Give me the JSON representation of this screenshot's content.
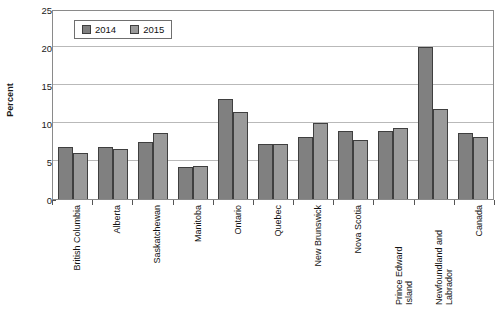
{
  "chart_data": {
    "type": "bar",
    "title": "",
    "xlabel": "",
    "ylabel": "Percent",
    "ylim": [
      0,
      25
    ],
    "yticks": [
      0,
      5,
      10,
      15,
      20,
      25
    ],
    "grid": true,
    "legend_position": "top-left-inside",
    "categories": [
      "British Columbia",
      "Alberta",
      "Saskatchewan",
      "Manitoba",
      "Ontario",
      "Quebec",
      "New Brunswick",
      "Nova Scotia",
      "Prince Edward Island",
      "Newfoundland and Labrador",
      "Canada"
    ],
    "series": [
      {
        "name": "2014",
        "color": "#808080",
        "values": [
          6.8,
          6.8,
          7.5,
          4.2,
          13.1,
          7.2,
          8.1,
          9.0,
          8.9,
          20.0,
          8.7
        ]
      },
      {
        "name": "2015",
        "color": "#9a9a9a",
        "values": [
          6.0,
          6.6,
          8.7,
          4.3,
          11.5,
          7.2,
          10.0,
          7.7,
          9.3,
          11.9,
          8.2
        ]
      }
    ]
  },
  "axes": {
    "y_title": "Percent",
    "y_tick_labels": [
      "0",
      "5",
      "10",
      "15",
      "20",
      "25"
    ]
  },
  "legend": {
    "items": [
      {
        "label": "2014"
      },
      {
        "label": "2015"
      }
    ]
  },
  "x_labels": [
    {
      "line1": "British Columbia",
      "line2": ""
    },
    {
      "line1": "Alberta",
      "line2": ""
    },
    {
      "line1": "Saskatchewan",
      "line2": ""
    },
    {
      "line1": "Manitoba",
      "line2": ""
    },
    {
      "line1": "Ontario",
      "line2": ""
    },
    {
      "line1": "Quebec",
      "line2": ""
    },
    {
      "line1": "New Brunswick",
      "line2": ""
    },
    {
      "line1": "Nova Scotia",
      "line2": ""
    },
    {
      "line1": "Prince Edward",
      "line2": "Island"
    },
    {
      "line1": "Newfoundland and",
      "line2": "Labrador"
    },
    {
      "line1": "Canada",
      "line2": ""
    }
  ]
}
